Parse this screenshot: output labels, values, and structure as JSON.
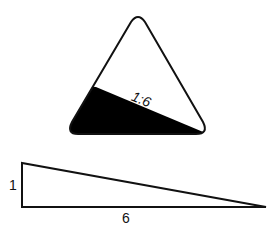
{
  "sign": {
    "grade_label": "1:6",
    "fill_color": "#000000",
    "stroke_color": "#111111",
    "background": "#ffffff"
  },
  "ratio_triangle": {
    "rise_label": "1",
    "run_label": "6"
  }
}
